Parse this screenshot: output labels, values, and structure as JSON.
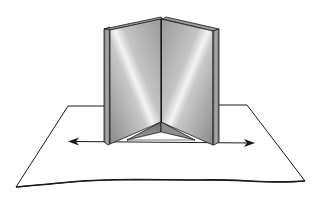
{
  "diagram": {
    "elements": [
      "paper-sheet",
      "left-mirror",
      "right-mirror",
      "hinge",
      "double-headed-arrow",
      "reflected-triangle"
    ],
    "colors": {
      "outline": "#1a1a1a",
      "mirror_light": "#f2f2f2",
      "mirror_mid": "#b8b8b8",
      "mirror_dark": "#7a7a7a",
      "edge_dark": "#5a5a5a",
      "paper": "#ffffff"
    }
  }
}
